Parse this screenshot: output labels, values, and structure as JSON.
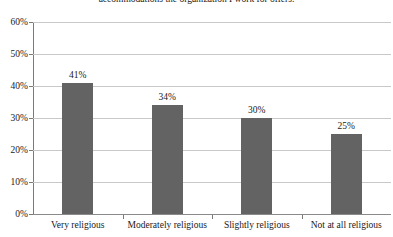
{
  "chart_data": {
    "type": "bar",
    "title": "accommodations the organization I work for offers.",
    "xlabel": "",
    "ylabel": "",
    "categories": [
      "Very religious",
      "Moderately religious",
      "Slightly religious",
      "Not at all religious"
    ],
    "values": [
      41,
      34,
      30,
      25
    ],
    "value_labels": [
      "41%",
      "34%",
      "30%",
      "25%"
    ],
    "ylim": [
      0,
      60
    ],
    "y_ticks": [
      0,
      10,
      20,
      30,
      40,
      50,
      60
    ],
    "y_tick_labels": [
      "0%",
      "10%",
      "20%",
      "30%",
      "40%",
      "50%",
      "60%"
    ],
    "grid": true,
    "legend": "none",
    "bar_color": "#636363",
    "gridline_color": "#c9c9c9",
    "axis_color": "#7a7a7a"
  }
}
